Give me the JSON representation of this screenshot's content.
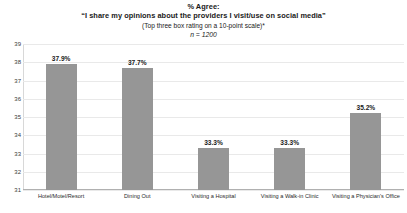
{
  "chart_data": {
    "type": "bar",
    "title": "% Agree:",
    "title_line_2": "“I share my opinions about the providers I visit/use on social media”",
    "subtitle": "(Top three box rating on a 10-point scale)*",
    "sample_size_note": "n = 1200",
    "categories": [
      "Hotel/Motel/Resort",
      "Dining Out",
      "Visiting a Hospital",
      "Visiting a Walk-in Clinic",
      "Visiting a Physician's Office"
    ],
    "values": [
      37.9,
      37.7,
      33.3,
      33.3,
      35.2
    ],
    "value_labels": [
      "37.9%",
      "37.7%",
      "33.3%",
      "33.3%",
      "35.2%"
    ],
    "xlabel": "",
    "ylabel": "",
    "ylim": [
      31,
      39
    ],
    "yticks": [
      39,
      38,
      37,
      36,
      35,
      34,
      33,
      32,
      31
    ],
    "ytick_labels": [
      "39",
      "38",
      "37",
      "36",
      "35",
      "34",
      "33",
      "32",
      "31"
    ],
    "grid": true,
    "legend": null,
    "bar_color": "#969696",
    "text_color": "#1a1a1a",
    "gridline_color": "#e9e9e9",
    "background_color": "#ffffff"
  }
}
